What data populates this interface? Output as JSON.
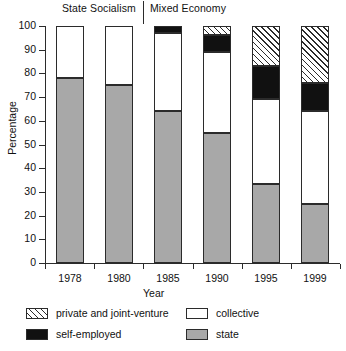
{
  "chart_data": {
    "type": "bar",
    "variant": "stacked-100",
    "title": "",
    "xlabel": "Year",
    "ylabel": "Percentage",
    "ylim": [
      0,
      100
    ],
    "ytick_step": 10,
    "yticks": [
      0,
      10,
      20,
      30,
      40,
      50,
      60,
      70,
      80,
      90,
      100
    ],
    "grid": false,
    "legend_position": "bottom",
    "categories": [
      "1978",
      "1980",
      "1985",
      "1990",
      "1995",
      "1999"
    ],
    "series": [
      {
        "name": "state",
        "values": [
          78,
          75,
          64,
          55,
          33.5,
          25
        ]
      },
      {
        "name": "collective",
        "values": [
          22,
          25,
          33,
          34,
          35.5,
          39
        ]
      },
      {
        "name": "self-employed",
        "values": [
          0,
          0,
          3,
          7,
          14,
          12
        ]
      },
      {
        "name": "private and joint-venture",
        "values": [
          0,
          0,
          0,
          4,
          17,
          24
        ]
      }
    ],
    "annotations": [
      {
        "text": "State Socialism",
        "covers": [
          "1978",
          "1980"
        ]
      },
      {
        "text": "Mixed Economy",
        "covers": [
          "1985",
          "1990",
          "1995",
          "1999"
        ]
      }
    ]
  },
  "periods": {
    "state_socialism": "State Socialism",
    "mixed_economy": "Mixed Economy"
  },
  "axes": {
    "y_title": "Percentage",
    "x_title": "Year",
    "y_labels": [
      "100",
      "90",
      "80",
      "70",
      "60",
      "50",
      "40",
      "30",
      "20",
      "10",
      "0"
    ],
    "x_labels": [
      "1978",
      "1980",
      "1985",
      "1990",
      "1995",
      "1999"
    ]
  },
  "legend": {
    "private": "private and joint-venture",
    "collective": "collective",
    "self_employed": "self-employed",
    "state": "state"
  },
  "colors": {
    "state": "#a8a8a8",
    "collective": "#ffffff",
    "self_employed": "#111111",
    "private": "#ffffff",
    "outline": "#2b2b2b"
  }
}
